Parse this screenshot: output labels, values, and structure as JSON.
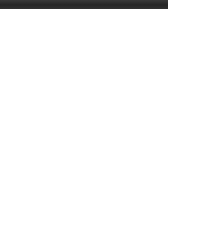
{
  "top_strip": {
    "color": "#2e2e2e"
  },
  "diagram": {
    "fret_label": "11 fr",
    "string_count": 6,
    "fret_count": 5,
    "marker_color": "#4a4a4a",
    "line_color": "#8a8a8a"
  },
  "chart_data": {
    "type": "table",
    "subtitle": "",
    "xlabel": "string",
    "ylabel": "fret",
    "position_label": "11 fr",
    "strings": [
      1,
      2,
      3,
      4,
      5,
      6
    ],
    "frets": [
      11,
      12,
      13,
      14,
      15
    ],
    "fret_rows": [
      "11",
      "12",
      "13",
      "14",
      "15"
    ],
    "legend": [
      "filled dot = fretted note",
      "open square = root / alternate voicing"
    ],
    "markers": [
      {
        "string": 2,
        "fret": 11,
        "shape": "dot",
        "x": 50,
        "y": 50
      },
      {
        "string": 1,
        "fret": 12,
        "shape": "dot",
        "x": 20,
        "y": 88
      },
      {
        "string": 3,
        "fret": 12,
        "shape": "dot",
        "x": 80,
        "y": 88
      },
      {
        "string": 4,
        "fret": 12,
        "shape": "dot",
        "x": 110,
        "y": 88
      },
      {
        "string": 6,
        "fret": 12,
        "shape": "dot",
        "x": 170,
        "y": 88
      },
      {
        "string": 1,
        "fret": 13,
        "shape": "square",
        "x": 20,
        "y": 126
      },
      {
        "string": 2,
        "fret": 13,
        "shape": "dot",
        "x": 50,
        "y": 126
      },
      {
        "string": 4,
        "fret": 13,
        "shape": "dot",
        "x": 110,
        "y": 126
      },
      {
        "string": 5,
        "fret": 13,
        "shape": "dot",
        "x": 140,
        "y": 126
      },
      {
        "string": 6,
        "fret": 13,
        "shape": "square",
        "x": 170,
        "y": 126
      },
      {
        "string": 3,
        "fret": 14,
        "shape": "dot",
        "x": 80,
        "y": 164
      },
      {
        "string": 1,
        "fret": 15,
        "shape": "dot",
        "x": 20,
        "y": 203
      },
      {
        "string": 2,
        "fret": 15,
        "shape": "dot",
        "x": 50,
        "y": 203
      },
      {
        "string": 3,
        "fret": 15,
        "shape": "square",
        "x": 80,
        "y": 203
      },
      {
        "string": 4,
        "fret": 15,
        "shape": "dot",
        "x": 110,
        "y": 203
      },
      {
        "string": 5,
        "fret": 15,
        "shape": "dot",
        "x": 140,
        "y": 203
      },
      {
        "string": 6,
        "fret": 15,
        "shape": "dot",
        "x": 170,
        "y": 203
      }
    ],
    "string_x": [
      20,
      50,
      80,
      110,
      140,
      170
    ],
    "fret_y": [
      30,
      68,
      106,
      144,
      182,
      220
    ],
    "grid": true,
    "legend_position": "right"
  }
}
